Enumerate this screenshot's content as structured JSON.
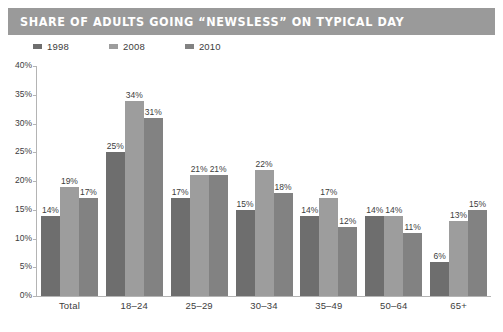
{
  "title": "SHARE OF ADULTS GOING “NEWSLESS” ON TYPICAL DAY",
  "theme": {
    "banner_bg": "#9a9a9a",
    "banner_text": "#ffffff",
    "axis_color": "#b4b4b4",
    "text_color": "#3d3d3d",
    "series_colors": [
      "#6e6e6e",
      "#9d9d9d",
      "#828282"
    ]
  },
  "legend": {
    "position": "top-left",
    "items": [
      {
        "label": "1998",
        "color": "#6e6e6e",
        "swatch": "legend-swatch-1998"
      },
      {
        "label": "2008",
        "color": "#9d9d9d",
        "swatch": "legend-swatch-2008"
      },
      {
        "label": "2010",
        "color": "#828282",
        "swatch": "legend-swatch-2010"
      }
    ]
  },
  "yaxis": {
    "ticks": [
      "0%",
      "5%",
      "10%",
      "15%",
      "20%",
      "25%",
      "30%",
      "35%",
      "40%"
    ]
  },
  "chart_data": {
    "type": "bar",
    "title": "SHARE OF ADULTS GOING “NEWSLESS” ON TYPICAL DAY",
    "xlabel": "",
    "ylabel": "",
    "ylim": [
      0,
      40
    ],
    "ytick_values": [
      0,
      5,
      10,
      15,
      20,
      25,
      30,
      35,
      40
    ],
    "ytick_labels": [
      "0%",
      "5%",
      "10%",
      "15%",
      "20%",
      "25%",
      "30%",
      "35%",
      "40%"
    ],
    "grid": false,
    "legend_position": "top-left",
    "categories": [
      "Total",
      "18–24",
      "25–29",
      "30–34",
      "35–49",
      "50–64",
      "65+"
    ],
    "series": [
      {
        "name": "1998",
        "color": "#6e6e6e",
        "values": [
          14,
          25,
          17,
          15,
          14,
          14,
          6
        ],
        "labels": [
          "14%",
          "25%",
          "17%",
          "15%",
          "14%",
          "14%",
          "6%"
        ]
      },
      {
        "name": "2008",
        "color": "#9d9d9d",
        "values": [
          19,
          34,
          21,
          22,
          17,
          14,
          13
        ],
        "labels": [
          "19%",
          "34%",
          "21%",
          "22%",
          "17%",
          "14%",
          "13%"
        ]
      },
      {
        "name": "2010",
        "color": "#828282",
        "values": [
          17,
          31,
          21,
          18,
          12,
          11,
          15
        ],
        "labels": [
          "17%",
          "31%",
          "21%",
          "18%",
          "12%",
          "11%",
          "15%"
        ]
      }
    ]
  }
}
